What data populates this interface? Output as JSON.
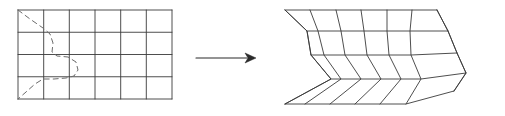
{
  "figure": {
    "name": "grid-deformation-diagram",
    "stroke_color": "#3a3a3a",
    "dashed_color": "#6b6b6b",
    "background": "#ffffff",
    "stroke_width": 0.9
  },
  "source_grid": {
    "label": "source-rectangular-grid",
    "columns": 6,
    "rows": 4,
    "x0": 18,
    "y0": 10,
    "x1": 172,
    "y1": 99,
    "x_lines": [
      18,
      43.7,
      69.3,
      95,
      120.7,
      146.3,
      172
    ],
    "y_lines": [
      10,
      32.25,
      54.5,
      76.75,
      99
    ]
  },
  "dashed_curve": {
    "label": "boundary-curve",
    "dash_pattern": "5 4",
    "points": [
      [
        18,
        10
      ],
      [
        30,
        19
      ],
      [
        43,
        28
      ],
      [
        50,
        34
      ],
      [
        53,
        43
      ],
      [
        52,
        52
      ],
      [
        57,
        56
      ],
      [
        68,
        57
      ],
      [
        76,
        62
      ],
      [
        78,
        70
      ],
      [
        74,
        76
      ],
      [
        66,
        78
      ],
      [
        54,
        79
      ],
      [
        43,
        79
      ],
      [
        35,
        84
      ],
      [
        26,
        92
      ],
      [
        18,
        99
      ]
    ]
  },
  "arrow": {
    "label": "transformation-arrow",
    "x_start": 196,
    "x_end": 256,
    "y": 58,
    "head_length": 11,
    "head_half_width": 5
  },
  "result_mesh": {
    "label": "deformed-grid",
    "columns": 6,
    "rows": 4,
    "nodes": [
      [
        [
          285,
          10
        ],
        [
          310,
          10
        ],
        [
          336,
          10
        ],
        [
          361,
          10
        ],
        [
          387,
          10
        ],
        [
          412,
          10
        ],
        [
          437,
          10
        ]
      ],
      [
        [
          307,
          31
        ],
        [
          318,
          31
        ],
        [
          341,
          31
        ],
        [
          364,
          31
        ],
        [
          387,
          31
        ],
        [
          410,
          31
        ],
        [
          448,
          31
        ]
      ],
      [
        [
          311,
          55
        ],
        [
          324,
          55
        ],
        [
          345,
          55
        ],
        [
          367,
          55
        ],
        [
          389,
          55
        ],
        [
          411,
          55
        ],
        [
          457,
          53
        ]
      ],
      [
        [
          331,
          79
        ],
        [
          341,
          79
        ],
        [
          361,
          79
        ],
        [
          381,
          79
        ],
        [
          401,
          79
        ],
        [
          421,
          79
        ],
        [
          466,
          73
        ]
      ],
      [
        [
          285,
          104
        ],
        [
          305,
          104
        ],
        [
          330,
          104
        ],
        [
          355,
          104
        ],
        [
          380,
          104
        ],
        [
          406,
          104
        ],
        [
          454,
          91
        ]
      ]
    ],
    "outline_left": [
      [
        285,
        10
      ],
      [
        307,
        31
      ],
      [
        311,
        55
      ],
      [
        331,
        79
      ],
      [
        285,
        104
      ]
    ],
    "outline_right": [
      [
        437,
        10
      ],
      [
        448,
        31
      ],
      [
        457,
        53
      ],
      [
        466,
        73
      ],
      [
        454,
        91
      ]
    ]
  }
}
